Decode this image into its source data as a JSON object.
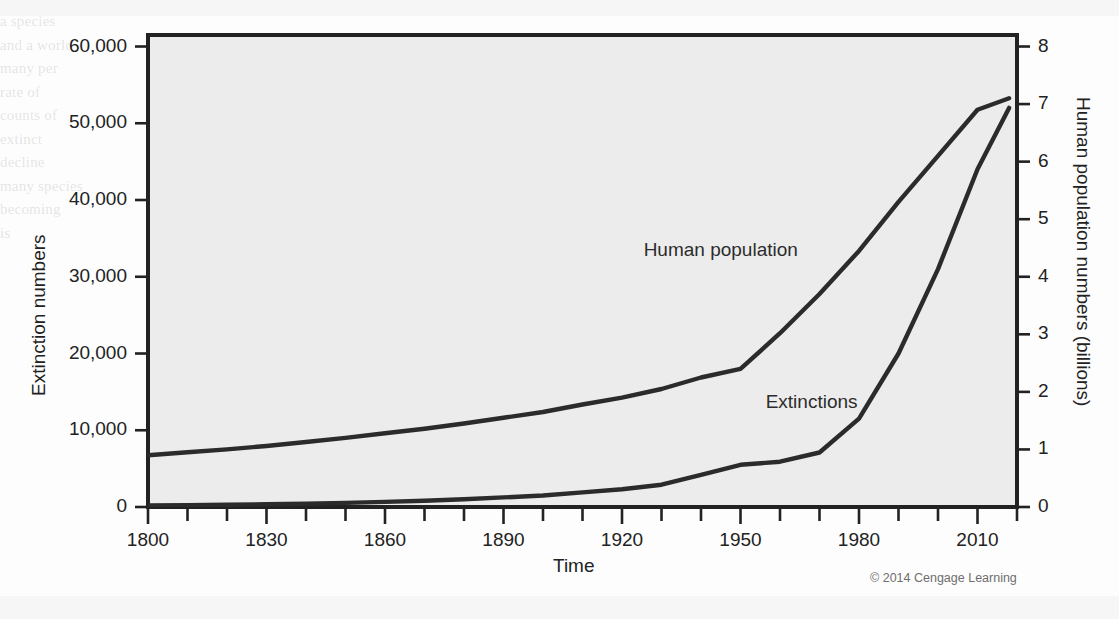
{
  "figure": {
    "credit": "© 2014 Cengage Learning",
    "background_color": "#fdfdfd",
    "plot_fill_color": "#ececec",
    "axis_color": "#222222"
  },
  "ghost_text": {
    "bleed_through": "a species\nand a world\nmany per\nrate of\ncounts of\nextinct\ndecline\nmany species\nbecoming\nis\n"
  },
  "chart_data": {
    "type": "line",
    "title": "",
    "xlabel": "Time",
    "ylabel": "Extinction numbers",
    "ylabel_right": "Human population numbers (billions)",
    "xlim": [
      1800,
      2020
    ],
    "ylim_left": [
      0,
      61500
    ],
    "ylim_right": [
      0,
      8.2
    ],
    "grid": false,
    "legend_position": "inline-annotations",
    "x_ticks_major": [
      1800,
      1830,
      1860,
      1890,
      1920,
      1950,
      1980,
      2010
    ],
    "x_ticks_minor_step": 10,
    "y_ticks_left": [
      0,
      10000,
      20000,
      30000,
      40000,
      50000,
      60000
    ],
    "y_tick_labels_left": [
      "0",
      "10,000",
      "20,000",
      "30,000",
      "40,000",
      "50,000",
      "60,000"
    ],
    "y_ticks_right": [
      0,
      1,
      2,
      3,
      4,
      5,
      6,
      7,
      8
    ],
    "y_tick_labels_right": [
      "0",
      "1",
      "2",
      "3",
      "4",
      "5",
      "6",
      "7",
      "8"
    ],
    "series": [
      {
        "name": "Human population",
        "axis": "right",
        "units": "billions",
        "color": "#2b2b2b",
        "label_x": 1945,
        "label_y": 4.45,
        "x": [
          1800,
          1810,
          1820,
          1830,
          1840,
          1850,
          1860,
          1870,
          1880,
          1890,
          1900,
          1910,
          1920,
          1930,
          1940,
          1950,
          1960,
          1970,
          1980,
          1990,
          2000,
          2010,
          2018
        ],
        "values": [
          0.9,
          0.95,
          1.0,
          1.06,
          1.13,
          1.2,
          1.28,
          1.36,
          1.45,
          1.55,
          1.65,
          1.78,
          1.9,
          2.05,
          2.25,
          2.4,
          3.02,
          3.7,
          4.45,
          5.3,
          6.1,
          6.9,
          7.1
        ]
      },
      {
        "name": "Extinctions",
        "axis": "left",
        "units": "species",
        "color": "#2b2b2b",
        "label_x": 1968,
        "label_y": 13500,
        "x": [
          1800,
          1810,
          1820,
          1830,
          1840,
          1850,
          1860,
          1870,
          1880,
          1890,
          1900,
          1910,
          1920,
          1930,
          1940,
          1950,
          1960,
          1970,
          1980,
          1990,
          2000,
          2010,
          2018
        ],
        "values": [
          200,
          240,
          290,
          350,
          430,
          530,
          660,
          820,
          1020,
          1250,
          1500,
          1900,
          2300,
          2900,
          4200,
          5500,
          5900,
          7100,
          11500,
          20000,
          31000,
          44000,
          52000
        ]
      }
    ],
    "annotations": [
      {
        "text": "Human population",
        "x": 1945,
        "y": 4.45,
        "axis": "right"
      },
      {
        "text": "Extinctions",
        "x": 1968,
        "y": 13500,
        "axis": "left"
      }
    ]
  }
}
